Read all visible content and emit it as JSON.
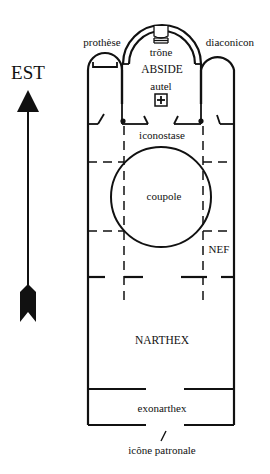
{
  "diagram": {
    "type": "floor-plan",
    "colors": {
      "ink": "#111111",
      "background": "#ffffff"
    },
    "compass": {
      "label": "EST",
      "icon": "arrow-up-icon"
    },
    "labels": {
      "prothese": "prothèse",
      "trone": "trône",
      "diaconicon": "diaconicon",
      "abside": "ABSIDE",
      "autel": "autel",
      "iconostase": "iconostase",
      "coupole": "coupole",
      "nef": "NEF",
      "narthex": "NARTHEX",
      "exonarthex": "exonarthex",
      "icone_patronale": "icône patronale"
    },
    "altar_symbol": "+"
  }
}
